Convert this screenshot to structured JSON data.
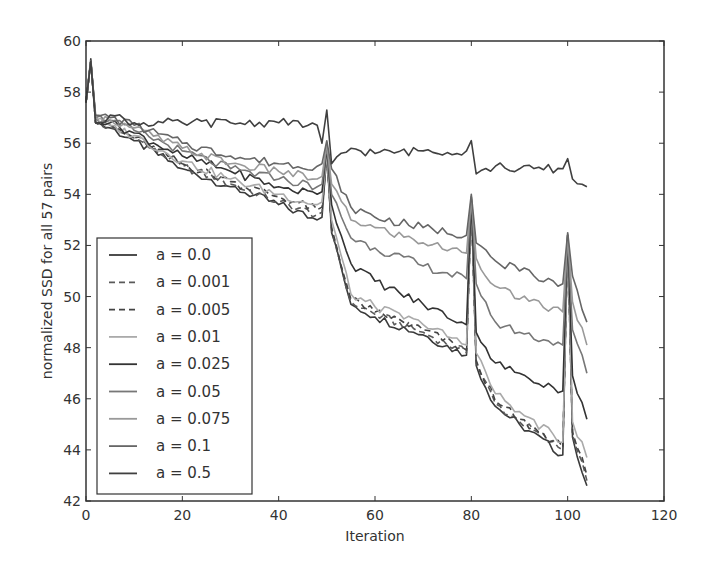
{
  "chart_data": {
    "type": "line",
    "title": "",
    "xlabel": "Iteration",
    "ylabel": "normalized SSD for all 57 pairs",
    "xlim": [
      0,
      120
    ],
    "ylim": [
      42,
      60
    ],
    "xticks": [
      0,
      20,
      40,
      60,
      80,
      100,
      120
    ],
    "yticks": [
      42,
      44,
      46,
      48,
      50,
      52,
      54,
      56,
      58,
      60
    ],
    "grid": false,
    "legend_position": "lower left",
    "x": [
      0,
      1,
      2,
      5,
      10,
      20,
      30,
      40,
      48,
      49,
      50,
      51,
      55,
      60,
      70,
      79,
      80,
      81,
      85,
      90,
      99,
      100,
      101,
      104
    ],
    "series": [
      {
        "name": "a = 0.0",
        "style": "solid",
        "color": "#3a3a3a",
        "values": [
          57.6,
          59.3,
          56.8,
          56.6,
          56.1,
          55.0,
          54.3,
          53.6,
          53.0,
          53.1,
          55.6,
          52.5,
          49.7,
          49.2,
          48.5,
          47.7,
          53.8,
          47.3,
          45.7,
          45.0,
          43.8,
          52.4,
          44.5,
          42.6
        ]
      },
      {
        "name": "a = 0.001",
        "style": "dashed",
        "color": "#5a5a5a",
        "values": [
          57.6,
          59.2,
          56.8,
          56.6,
          56.2,
          55.1,
          54.4,
          53.7,
          53.2,
          53.3,
          55.5,
          52.6,
          49.8,
          49.3,
          48.6,
          47.8,
          53.7,
          47.4,
          45.8,
          45.1,
          44.0,
          52.3,
          44.6,
          42.8
        ]
      },
      {
        "name": "a = 0.005",
        "style": "dashed",
        "color": "#444444",
        "values": [
          57.6,
          59.2,
          56.8,
          56.7,
          56.2,
          55.2,
          54.5,
          53.9,
          53.4,
          53.5,
          55.6,
          52.7,
          49.9,
          49.4,
          48.7,
          47.9,
          53.7,
          47.5,
          45.9,
          45.2,
          44.1,
          52.3,
          44.7,
          43.0
        ]
      },
      {
        "name": "a = 0.01",
        "style": "solid",
        "color": "#aaaaaa",
        "values": [
          57.6,
          59.2,
          56.9,
          56.7,
          56.3,
          55.3,
          54.6,
          54.0,
          53.6,
          53.7,
          55.6,
          53.0,
          50.1,
          49.6,
          48.9,
          48.1,
          53.7,
          47.8,
          46.2,
          45.5,
          44.3,
          52.3,
          45.1,
          43.7
        ]
      },
      {
        "name": "a = 0.025",
        "style": "solid",
        "color": "#333333",
        "values": [
          57.6,
          59.2,
          57.0,
          56.8,
          56.4,
          55.5,
          54.9,
          54.3,
          54.0,
          54.1,
          55.8,
          53.6,
          51.3,
          50.6,
          49.7,
          48.9,
          53.8,
          48.6,
          47.4,
          47.0,
          46.3,
          52.4,
          46.9,
          45.2
        ]
      },
      {
        "name": "a = 0.05",
        "style": "solid",
        "color": "#777777",
        "values": [
          57.6,
          59.2,
          57.0,
          56.9,
          56.5,
          55.7,
          55.0,
          54.6,
          54.3,
          54.4,
          55.9,
          54.0,
          52.3,
          51.9,
          51.2,
          50.7,
          53.9,
          50.5,
          49.0,
          48.6,
          48.1,
          52.4,
          48.7,
          47.0
        ]
      },
      {
        "name": "a = 0.075",
        "style": "solid",
        "color": "#999999",
        "values": [
          57.6,
          59.2,
          57.0,
          56.9,
          56.6,
          55.8,
          55.2,
          54.9,
          54.6,
          54.7,
          56.0,
          54.4,
          53.0,
          52.7,
          52.1,
          51.7,
          53.9,
          51.5,
          50.4,
          49.9,
          49.4,
          52.4,
          49.8,
          48.1
        ]
      },
      {
        "name": "a = 0.1",
        "style": "solid",
        "color": "#666666",
        "values": [
          57.6,
          59.2,
          57.1,
          57.0,
          56.7,
          56.0,
          55.5,
          55.2,
          55.1,
          55.2,
          56.1,
          55.0,
          53.5,
          53.1,
          52.7,
          52.4,
          54.0,
          52.1,
          51.4,
          51.0,
          50.5,
          52.5,
          50.8,
          49.0
        ]
      },
      {
        "name": "a = 0.5",
        "style": "solid",
        "color": "#404040",
        "values": [
          57.6,
          59.2,
          56.8,
          57.1,
          56.8,
          56.8,
          56.8,
          56.8,
          56.7,
          56.0,
          57.3,
          55.2,
          55.8,
          55.6,
          55.7,
          55.7,
          56.1,
          54.8,
          55.1,
          55.0,
          55.0,
          55.4,
          54.6,
          54.3
        ]
      }
    ]
  },
  "legend": {
    "items": [
      {
        "label": "a = 0.0"
      },
      {
        "label": "a = 0.001"
      },
      {
        "label": "a = 0.005"
      },
      {
        "label": "a = 0.01"
      },
      {
        "label": "a = 0.025"
      },
      {
        "label": "a = 0.05"
      },
      {
        "label": "a = 0.075"
      },
      {
        "label": "a = 0.1"
      },
      {
        "label": "a = 0.5"
      }
    ]
  },
  "axes": {
    "xlabel": "Iteration",
    "ylabel": "normalized SSD for all 57 pairs"
  }
}
